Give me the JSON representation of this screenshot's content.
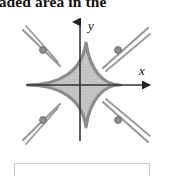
{
  "heading": {
    "text": "haded area in the",
    "note": "partially cropped line of body text at top of image"
  },
  "figure": {
    "name": "astroid-shaded-region",
    "axes": {
      "x_label": "x",
      "y_label": "y",
      "origin": {
        "x": 80,
        "y": 75
      },
      "x_axis_color": "#333333",
      "y_axis_color": "#333333",
      "x_axis_start": {
        "x": 26,
        "y": 75
      },
      "x_axis_end": {
        "x": 155,
        "y": 75
      },
      "y_axis_start": {
        "x": 80,
        "y": 130
      },
      "y_axis_end": {
        "x": 80,
        "y": 6
      },
      "x_label_pos": {
        "x": 141,
        "y": 62
      },
      "y_label_pos": {
        "x": 90,
        "y": 16
      }
    },
    "curve": {
      "type": "astroid",
      "radius_x": 46,
      "radius_y": 42,
      "stroke_color": "#8c8c8c",
      "stroke_width": 3.2,
      "fill_color": "#c4c4c4",
      "fill_opacity": 0.85
    },
    "tangent_lines": {
      "count": 4,
      "color": "#9a9a9a",
      "stroke_width": 2.2,
      "segments": [
        {
          "name": "tangent-upper-left",
          "x1": 24,
          "y1": 22,
          "x2": 58,
          "y2": 55
        },
        {
          "name": "tangent-upper-right",
          "x1": 146,
          "y1": 22,
          "x2": 104,
          "y2": 57
        },
        {
          "name": "tangent-lower-left",
          "x1": 24,
          "y1": 128,
          "x2": 58,
          "y2": 95
        },
        {
          "name": "tangent-lower-right",
          "x1": 146,
          "y1": 128,
          "x2": 104,
          "y2": 95
        }
      ]
    },
    "points": {
      "count": 4,
      "fill_color": "#8e8e8e",
      "stroke_color": "#6f6f6f",
      "radius": 3.4,
      "list": [
        {
          "name": "point-upper-left",
          "x": 42,
          "y": 40
        },
        {
          "name": "point-upper-right",
          "x": 118,
          "y": 40
        },
        {
          "name": "point-lower-left",
          "x": 42,
          "y": 110
        },
        {
          "name": "point-lower-right",
          "x": 118,
          "y": 110
        }
      ]
    }
  },
  "answer_box": {
    "value": "",
    "placeholder": "",
    "border_color": "#c9c9c9"
  },
  "colors": {
    "background": "#ffffff",
    "text": "#111111",
    "axis": "#333333",
    "curve": "#8c8c8c",
    "shade": "#c4c4c4",
    "tangent": "#9a9a9a",
    "marker": "#8e8e8e",
    "box_border": "#c9c9c9"
  }
}
